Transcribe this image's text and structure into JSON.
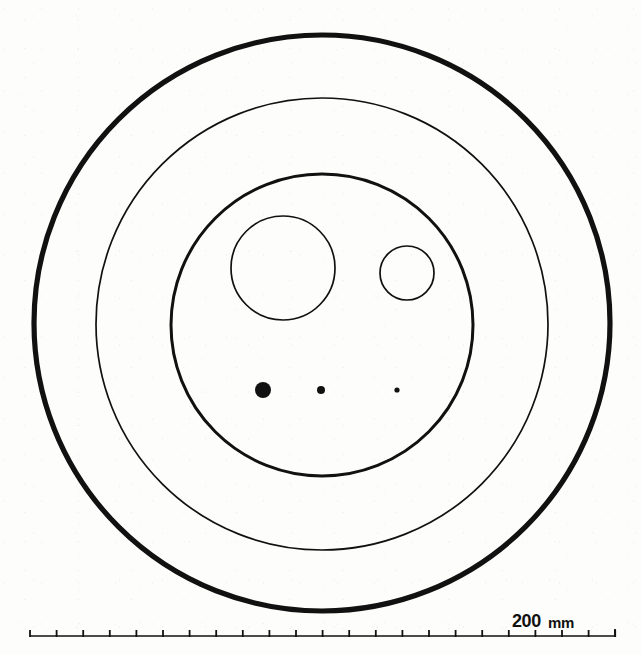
{
  "figure": {
    "kind": "technical-line-drawing",
    "background_color": "#fdfdfb",
    "ink_color": "#111111",
    "scale_bar": {
      "value_label": "200",
      "unit_label": "mm",
      "x_start": 30,
      "x_end": 615,
      "y": 636,
      "tick_count": 23,
      "tick_spacing": 26.6,
      "tick_height": 6,
      "line_width": 1.6,
      "label_span_start": 475,
      "label_span_end": 590
    }
  },
  "chart_data": {
    "type": "scatter",
    "title": "",
    "subtitle": "",
    "xlabel": "",
    "ylabel": "",
    "units": "mm",
    "scale_reference": {
      "label": "200 mm",
      "pixel_length": 233,
      "mm_per_pixel": 0.858
    },
    "annotations": [
      "200 mm"
    ],
    "legend": [],
    "grid": false,
    "axis_ranges": {
      "x": [
        0,
        642
      ],
      "y": [
        0,
        655
      ]
    },
    "shapes": [
      {
        "name": "outer-boundary-circle",
        "role": "outermost-contour",
        "geometry": "circle",
        "cx": 322,
        "cy": 323,
        "r": 288,
        "stroke_width": 5.2,
        "fill": "none",
        "stroke": "#111111",
        "diameter_mm": 494
      },
      {
        "name": "middle-ring-circle",
        "role": "second-contour",
        "geometry": "circle",
        "cx": 322,
        "cy": 324,
        "r": 226,
        "stroke_width": 1.7,
        "fill": "none",
        "stroke": "#111111",
        "diameter_mm": 388
      },
      {
        "name": "inner-boundary-circle",
        "role": "third-contour",
        "geometry": "circle",
        "cx": 322,
        "cy": 325,
        "r": 151,
        "stroke_width": 3.0,
        "fill": "none",
        "stroke": "#111111",
        "diameter_mm": 259
      },
      {
        "name": "large-inner-circle",
        "role": "inclusion-outline-large",
        "geometry": "circle",
        "cx": 283,
        "cy": 268,
        "r": 52,
        "stroke_width": 1.7,
        "fill": "none",
        "stroke": "#111111",
        "diameter_mm": 89
      },
      {
        "name": "small-inner-circle",
        "role": "inclusion-outline-small",
        "geometry": "circle",
        "cx": 407,
        "cy": 273,
        "r": 27,
        "stroke_width": 1.7,
        "fill": "none",
        "stroke": "#111111",
        "diameter_mm": 46
      },
      {
        "name": "filled-dot-large",
        "role": "point-marker",
        "geometry": "circle",
        "cx": 263,
        "cy": 390,
        "r": 8,
        "stroke_width": 0,
        "fill": "#111111",
        "stroke": "none",
        "diameter_mm": 14
      },
      {
        "name": "filled-dot-medium",
        "role": "point-marker",
        "geometry": "circle",
        "cx": 321,
        "cy": 390,
        "r": 4,
        "stroke_width": 0,
        "fill": "#111111",
        "stroke": "none",
        "diameter_mm": 7
      },
      {
        "name": "filled-dot-small",
        "role": "point-marker",
        "geometry": "circle",
        "cx": 397,
        "cy": 390,
        "r": 2.6,
        "stroke_width": 0,
        "fill": "#111111",
        "stroke": "none",
        "diameter_mm": 4
      }
    ]
  }
}
